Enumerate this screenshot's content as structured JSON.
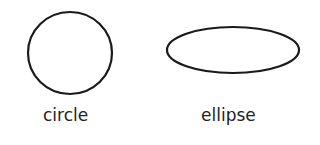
{
  "shapes": [
    {
      "name": "circle",
      "label": "circle",
      "cx": 70,
      "cy": 53,
      "rx": 42,
      "ry": 41
    },
    {
      "name": "ellipse",
      "label": "ellipse",
      "cx": 233,
      "cy": 50,
      "rx": 66,
      "ry": 23
    }
  ],
  "colors": {
    "stroke": "#1a1a1a",
    "text": "#222222",
    "background": "#ffffff"
  }
}
